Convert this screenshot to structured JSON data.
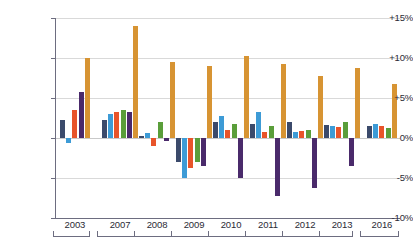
{
  "chart_data": {
    "type": "bar",
    "title": "",
    "subtitle": "",
    "xlabel": "",
    "ylabel": "",
    "ylim": [
      -10,
      15
    ],
    "ytick_labels": [
      "+15%",
      "+10%",
      "+5%",
      "0%",
      "-5%",
      "-10%"
    ],
    "ytick_values": [
      15,
      10,
      5,
      0,
      -5,
      -10
    ],
    "grid": true,
    "legend_position": "none",
    "categories": [
      "2003",
      "2007",
      "2008",
      "2009",
      "2010",
      "2011",
      "2012",
      "2013",
      "2016"
    ],
    "series": [
      {
        "name": "series-1",
        "color": "#3b4a6b",
        "values": [
          2.3,
          2.2,
          0.3,
          -3.0,
          2.0,
          1.7,
          2.0,
          1.6,
          1.5
        ]
      },
      {
        "name": "series-2",
        "color": "#3d9bd6",
        "values": [
          -0.6,
          3.0,
          0.6,
          -5.0,
          2.7,
          3.2,
          0.8,
          1.5,
          1.8
        ]
      },
      {
        "name": "series-3",
        "color": "#e8542a",
        "values": [
          3.5,
          3.3,
          -1.0,
          -3.8,
          1.0,
          0.8,
          0.9,
          1.4,
          1.5
        ]
      },
      {
        "name": "series-4",
        "color": "#5a9e3a",
        "values": [
          null,
          3.5,
          2.0,
          -3.0,
          1.8,
          1.5,
          1.0,
          2.0,
          1.2
        ]
      },
      {
        "name": "series-5",
        "color": "#4a2a6b",
        "values": [
          5.7,
          3.2,
          -0.4,
          -3.5,
          -5.0,
          -7.3,
          -6.3,
          -3.5,
          null
        ]
      },
      {
        "name": "series-6",
        "color": "#d79433",
        "values": [
          10.0,
          14.0,
          9.5,
          9.0,
          10.3,
          9.2,
          7.7,
          8.8,
          6.8
        ]
      }
    ]
  },
  "axis": {
    "ticks": [
      {
        "label": "+15%",
        "value": 15
      },
      {
        "label": "+10%",
        "value": 10
      },
      {
        "label": "+5%",
        "value": 5
      },
      {
        "label": "0%",
        "value": 0
      },
      {
        "label": "-5%",
        "value": -5
      },
      {
        "label": "-10%",
        "value": -10
      }
    ]
  }
}
